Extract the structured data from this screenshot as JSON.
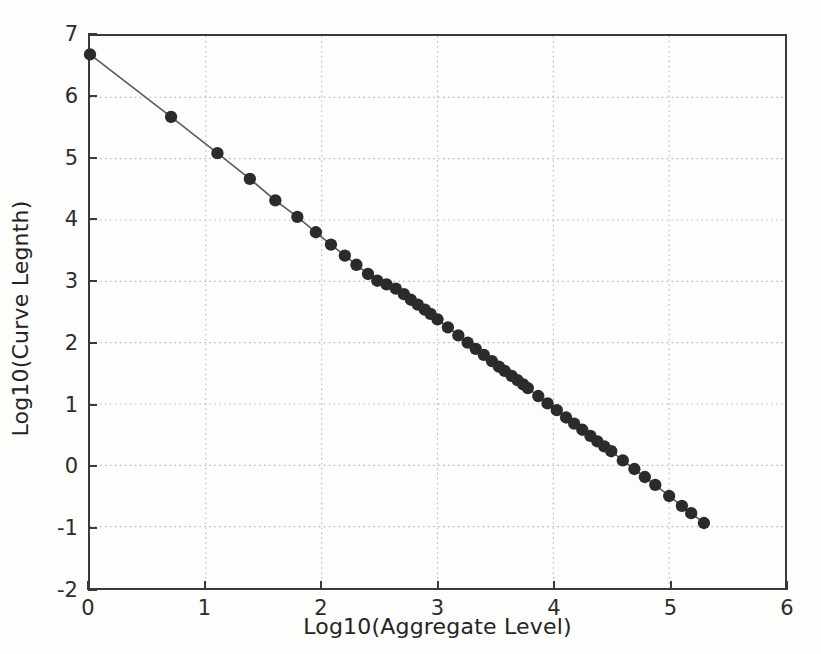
{
  "chart_data": {
    "type": "scatter",
    "title": "",
    "xlabel": "Log10(Aggregate Level)",
    "ylabel": "Log10(Curve Legnth)",
    "xlim": [
      0,
      6
    ],
    "ylim": [
      -2,
      7
    ],
    "xticks": [
      0,
      1,
      2,
      3,
      4,
      5,
      6
    ],
    "yticks": [
      -2,
      -1,
      0,
      1,
      2,
      3,
      4,
      5,
      6,
      7
    ],
    "xtick_labels": [
      "0",
      "1",
      "2",
      "3",
      "4",
      "5",
      "6"
    ],
    "ytick_labels": [
      "-2",
      "-1",
      "0",
      "1",
      "2",
      "3",
      "4",
      "5",
      "6",
      "7"
    ],
    "grid": true,
    "grid_style": "dotted",
    "legend": null,
    "marker_style": "filled-circle",
    "marker_color": "#2b2b2b",
    "line_color": "#5a5a5a",
    "series": [
      {
        "name": "curve length vs aggregate level",
        "x": [
          0.0,
          0.7,
          1.1,
          1.38,
          1.6,
          1.79,
          1.95,
          2.08,
          2.2,
          2.3,
          2.4,
          2.48,
          2.56,
          2.64,
          2.71,
          2.77,
          2.83,
          2.89,
          2.94,
          3.0,
          3.09,
          3.18,
          3.26,
          3.33,
          3.4,
          3.47,
          3.53,
          3.58,
          3.64,
          3.69,
          3.74,
          3.78,
          3.87,
          3.95,
          4.03,
          4.11,
          4.18,
          4.25,
          4.32,
          4.38,
          4.44,
          4.5,
          4.6,
          4.7,
          4.79,
          4.88,
          5.0,
          5.11,
          5.19,
          5.3
        ],
        "y": [
          6.7,
          5.68,
          5.09,
          4.67,
          4.32,
          4.05,
          3.8,
          3.6,
          3.42,
          3.27,
          3.12,
          3.01,
          2.95,
          2.88,
          2.79,
          2.7,
          2.62,
          2.54,
          2.47,
          2.38,
          2.25,
          2.12,
          2.0,
          1.9,
          1.8,
          1.7,
          1.61,
          1.54,
          1.46,
          1.39,
          1.32,
          1.26,
          1.13,
          1.01,
          0.9,
          0.78,
          0.68,
          0.58,
          0.48,
          0.39,
          0.31,
          0.23,
          0.08,
          -0.06,
          -0.19,
          -0.32,
          -0.5,
          -0.66,
          -0.78,
          -0.94
        ],
        "trend_slope": -1.5,
        "trend_intercept": 6.7
      }
    ]
  }
}
